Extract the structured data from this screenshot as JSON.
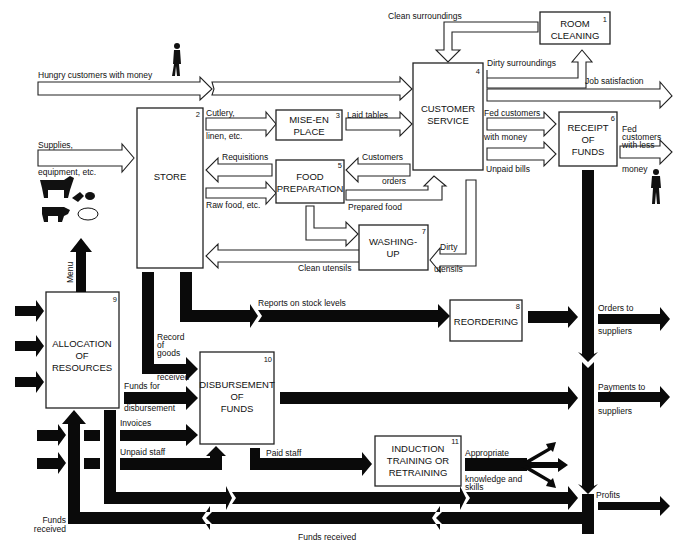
{
  "diagram": {
    "type": "restaurant systems flow diagram",
    "colors": {
      "line": "#222222",
      "solid_arrow": "#0a0a0a",
      "background": "#ffffff"
    },
    "boxes": [
      {
        "id": 1,
        "number": "1",
        "lines": [
          "ROOM",
          "CLEANING"
        ]
      },
      {
        "id": 2,
        "number": "2",
        "lines": [
          "STORE"
        ]
      },
      {
        "id": 3,
        "number": "3",
        "lines": [
          "MISE-EN",
          "PLACE"
        ]
      },
      {
        "id": 4,
        "number": "4",
        "lines": [
          "CUSTOMER",
          "SERVICE"
        ]
      },
      {
        "id": 5,
        "number": "5",
        "lines": [
          "FOOD",
          "PREPARATION"
        ]
      },
      {
        "id": 6,
        "number": "6",
        "lines": [
          "RECEIPT",
          "OF",
          "FUNDS"
        ]
      },
      {
        "id": 7,
        "number": "7",
        "lines": [
          "WASHING-",
          "UP"
        ]
      },
      {
        "id": 8,
        "number": "8",
        "lines": [
          "REORDERING"
        ]
      },
      {
        "id": 9,
        "number": "9",
        "lines": [
          "ALLOCATION",
          "OF",
          "RESOURCES"
        ]
      },
      {
        "id": 10,
        "number": "10",
        "lines": [
          "DISBURSEMENT",
          "OF",
          "FUNDS"
        ]
      },
      {
        "id": 11,
        "number": "11",
        "lines": [
          "INDUCTION",
          "TRAINING OR",
          "RETRAINING"
        ]
      }
    ],
    "labels": {
      "clean_surroundings": "Clean surroundings",
      "dirty_surroundings": "Dirty surroundings",
      "hungry_customers": "Hungry customers with money",
      "job_satisfaction": "Job satisfaction",
      "cutlery": "Cutlery,",
      "linen": "linen, etc.",
      "laid_tables": "Laid tables",
      "supplies": "Supplies,",
      "equipment": "equipment, etc.",
      "requisitions": "Requisitions",
      "raw_food": "Raw food, etc.",
      "customers": "Customers",
      "orders": "orders",
      "prepared_food": "Prepared food",
      "fed_customers": "Fed customers",
      "with_money": "with money",
      "unpaid_bills": "Unpaid bills",
      "fed_less_1": "Fed",
      "fed_less_2": "customers",
      "fed_less_3": "with less",
      "fed_less_4": "money",
      "dirty": "Dirty",
      "utensils": "utensils",
      "clean_utensils": "Clean utensils",
      "menu": "Menu",
      "reports": "Reports on stock levels",
      "record_1": "Record",
      "record_2": "of",
      "record_3": "goods",
      "record_4": "received",
      "funds_for": "Funds for",
      "disbursement": "disbursement",
      "invoices": "Invoices",
      "unpaid_staff": "Unpaid staff",
      "paid_staff": "Paid staff",
      "appropriate": "Appropriate",
      "knowledge": "knowledge and",
      "skills": "skills",
      "orders_to": "Orders to",
      "suppliers_1": "suppliers",
      "payments_to": "Payments to",
      "suppliers_2": "suppliers",
      "profits": "Profits",
      "funds_received_left_1": "Funds",
      "funds_received_left_2": "received",
      "funds_received_bottom": "Funds received"
    }
  }
}
